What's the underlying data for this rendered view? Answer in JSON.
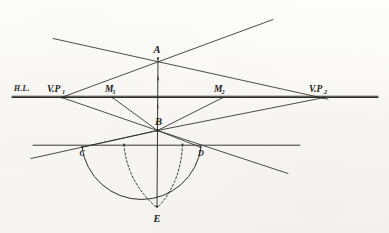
{
  "figure": {
    "kind": "hand-drawn-perspective-construction",
    "title_visible": false,
    "background_color": "#faf9f6",
    "ink_color": "#2e2c2b",
    "width": 389,
    "height": 233
  },
  "labels": {
    "horizon_line": "H.L.",
    "vanishing_point_left": "V.P",
    "vanishing_point_left_sub": "1",
    "vanishing_point_right": "V.P",
    "vanishing_point_right_sub": "2",
    "measuring_point_left": "M",
    "measuring_point_left_sub": "1",
    "measuring_point_right": "M",
    "measuring_point_right_sub": "2",
    "point_a": "A",
    "point_b": "B",
    "point_c": "C",
    "point_d": "D",
    "point_e": "E"
  },
  "points": {
    "A": {
      "x": 158,
      "y": 58.5
    },
    "B": {
      "x": 157,
      "y": 130
    },
    "C": {
      "x": 82,
      "y": 147
    },
    "D": {
      "x": 200,
      "y": 147
    },
    "E": {
      "x": 157,
      "y": 206
    },
    "VP1": {
      "x": 63,
      "y": 97
    },
    "VP2": {
      "x": 323,
      "y": 97
    },
    "M1": {
      "x": 113,
      "y": 97
    },
    "M2": {
      "x": 222,
      "y": 97
    }
  },
  "label_positions": {
    "horizon_line": {
      "x": 14,
      "y": 91
    },
    "VP1": {
      "x": 48,
      "y": 91
    },
    "VP2": {
      "x": 310,
      "y": 91
    },
    "M1": {
      "x": 105,
      "y": 92
    },
    "M2": {
      "x": 214,
      "y": 92
    },
    "A": {
      "x": 154,
      "y": 52
    },
    "B": {
      "x": 156,
      "y": 124
    },
    "C": {
      "x": 81,
      "y": 155
    },
    "D": {
      "x": 199,
      "y": 155
    },
    "E": {
      "x": 154,
      "y": 221
    }
  },
  "lines": {
    "horizon": {
      "x1": 12,
      "y1": 97,
      "x2": 378,
      "y2": 97
    },
    "ground_line": {
      "x1": 33,
      "y1": 145,
      "x2": 300,
      "y2": 145
    },
    "vertical_axis": {
      "x1": 158,
      "y1": 58,
      "x2": 157,
      "y2": 207
    },
    "a_to_vp2": {
      "x1": 53,
      "y1": 39,
      "x2": 327,
      "y2": 99
    },
    "vp1_to_upper_r": {
      "x1": 61,
      "y1": 97,
      "x2": 272,
      "y2": 20
    },
    "vp1_to_b": {
      "x1": 62,
      "y1": 97,
      "x2": 157,
      "y2": 130
    },
    "vp2_to_b": {
      "x1": 324,
      "y1": 97,
      "x2": 157,
      "y2": 130
    },
    "b_lower_left": {
      "x1": 157,
      "y1": 130,
      "x2": 31,
      "y2": 158
    },
    "b_lower_right": {
      "x1": 157,
      "y1": 130,
      "x2": 287,
      "y2": 173
    },
    "m1_to_b": {
      "x1": 113,
      "y1": 98,
      "x2": 157,
      "y2": 130
    },
    "m2_to_b": {
      "x1": 222,
      "y1": 98,
      "x2": 157,
      "y2": 130
    },
    "b_to_c": {
      "x1": 157,
      "y1": 130,
      "x2": 82,
      "y2": 147
    },
    "b_to_d": {
      "x1": 157,
      "y1": 130,
      "x2": 200,
      "y2": 147
    }
  },
  "arc": {
    "description": "semicircle from C through E to D",
    "start": {
      "x": 82,
      "y": 147
    },
    "end": {
      "x": 201,
      "y": 147
    },
    "radius": 60,
    "sweep": 1
  },
  "dashed_curves": {
    "left": {
      "from": {
        "x": 124,
        "y": 144
      },
      "to": {
        "x": 155,
        "y": 206
      },
      "ctrl": {
        "x": 129,
        "y": 180
      }
    },
    "right": {
      "from": {
        "x": 182,
        "y": 144
      },
      "to": {
        "x": 158,
        "y": 206
      },
      "ctrl": {
        "x": 180,
        "y": 181
      }
    }
  },
  "tick_marks": [
    {
      "x": 158,
      "y": 78,
      "len": 3
    },
    {
      "x": 158,
      "y": 106,
      "len": 3
    }
  ]
}
